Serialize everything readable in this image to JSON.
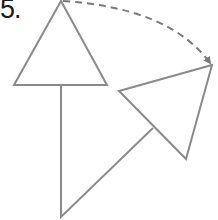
{
  "problem": {
    "number_label": "5."
  },
  "diagram": {
    "stroke_color": "#8a8a8a",
    "arrow_color": "#7a7a7a",
    "shapes": [
      {
        "name": "original-triangle",
        "points": "61,1 14,85 107,85"
      },
      {
        "name": "stem-triangle",
        "points": "61,85 61,217 153,128"
      },
      {
        "name": "rotated-triangle",
        "points": "119,91 212,65 186,159"
      }
    ],
    "rotation_arrow": {
      "path": "M 63,1 Q 170,8 210,63",
      "style": "dashed",
      "direction": "clockwise"
    }
  }
}
